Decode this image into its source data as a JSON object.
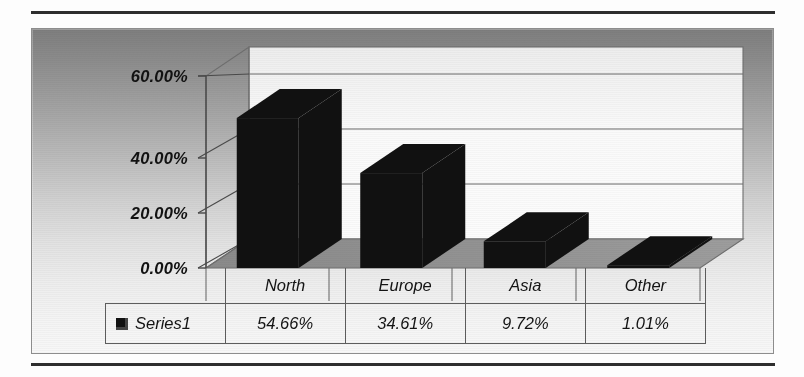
{
  "document": {
    "rules": [
      "top-rule",
      "bottom-rule"
    ]
  },
  "chart_data": {
    "type": "bar",
    "title": "",
    "subtitle": "",
    "xlabel": "",
    "ylabel": "",
    "categories": [
      "North",
      "Europe",
      "Asia",
      "Other"
    ],
    "series": [
      {
        "name": "Series1",
        "values": [
          54.66,
          34.61,
          9.72,
          1.01
        ],
        "value_labels": [
          "54.66%",
          "34.61%",
          "9.72%",
          "1.01%"
        ],
        "color": "#111111"
      }
    ],
    "ylim": [
      0,
      70
    ],
    "yticks": [
      0,
      20,
      40,
      60
    ],
    "ytick_labels": [
      "0.00%",
      "20.00%",
      "40.00%",
      "60.00%"
    ],
    "grid": true,
    "gridlines_on": "back-wall-horizontal",
    "legend_position": "data-table-left",
    "style": "3d-column",
    "plot_background": "gray-vertical-gradient",
    "wall_color": "#f2f2f2",
    "floor_color": "#8f8f8f",
    "frame_color": "#8d8d8d"
  },
  "table": {
    "legend_label": "Series1",
    "legend_swatch": "black-square-marker",
    "header_cells": [
      "North",
      "Europe",
      "Asia",
      "Other"
    ],
    "data_cells": [
      "54.66%",
      "34.61%",
      "9.72%",
      "1.01%"
    ]
  },
  "axis": {
    "ytick_labels": [
      "60.00%",
      "40.00%",
      "20.00%",
      "0.00%"
    ]
  }
}
